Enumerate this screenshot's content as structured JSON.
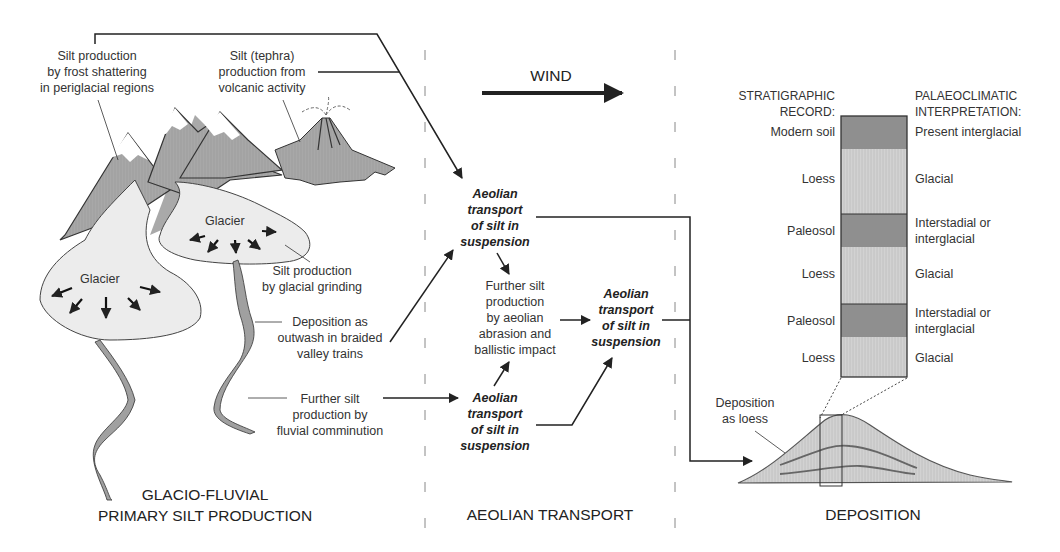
{
  "left_section": {
    "title_line1": "GLACIO-FLUVIAL",
    "title_line2": "PRIMARY SILT PRODUCTION",
    "frost": [
      "Silt production",
      "by frost shattering",
      "in periglacial regions"
    ],
    "tephra": [
      "Silt (tephra)",
      "production from",
      "volcanic activity"
    ],
    "glacier_label": "Glacier",
    "glacial_grinding": [
      "Silt production",
      "by glacial grinding"
    ],
    "outwash": [
      "Deposition as",
      "outwash in braided",
      "valley trains"
    ],
    "fluvial": [
      "Further silt",
      "production by",
      "fluvial comminution"
    ]
  },
  "middle_section": {
    "title": "AEOLIAN TRANSPORT",
    "wind_label": "WIND",
    "aeolian_transport": [
      "Aeolian",
      "transport",
      "of silt in",
      "suspension"
    ],
    "aeolian_right": [
      "Aeolian",
      "transport",
      "of silt in",
      "suspension"
    ],
    "abrasion": [
      "Further silt",
      "production",
      "by aeolian",
      "abrasion and",
      "ballistic impact"
    ]
  },
  "right_section": {
    "title": "DEPOSITION",
    "strat_header": [
      "STRATIGRAPHIC",
      "RECORD:"
    ],
    "palaeo_header": [
      "PALAEOCLIMATIC",
      "INTERPRETATION:"
    ],
    "layers": [
      {
        "record": "Modern soil",
        "interpretation": [
          "Present interglacial"
        ],
        "type": "soil"
      },
      {
        "record": "Loess",
        "interpretation": [
          "Glacial"
        ],
        "type": "loess"
      },
      {
        "record": "Paleosol",
        "interpretation": [
          "Interstadial or",
          "interglacial"
        ],
        "type": "soil"
      },
      {
        "record": "Loess",
        "interpretation": [
          "Glacial"
        ],
        "type": "loess"
      },
      {
        "record": "Paleosol",
        "interpretation": [
          "Interstadial or",
          "interglacial"
        ],
        "type": "soil"
      },
      {
        "record": "Loess",
        "interpretation": [
          "Glacial"
        ],
        "type": "loess"
      }
    ],
    "deposition_label": [
      "Deposition",
      "as loess"
    ]
  },
  "colors": {
    "soil": "#8f8f8f",
    "loess": "#cfcfcf",
    "mountain": "#a9a9a9",
    "glacier": "#ececec",
    "line": "#222222"
  }
}
